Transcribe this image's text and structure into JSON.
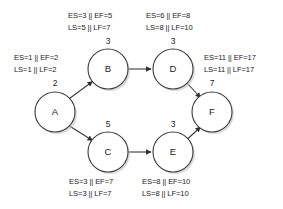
{
  "diagram": {
    "type": "activity-on-node-network",
    "separator": "||",
    "nodes": [
      {
        "id": "A",
        "label": "A",
        "duration": "2",
        "cx": 55,
        "cy": 112,
        "r": 20,
        "annotation": {
          "early": "ES=1 || EF=2",
          "late": "LS=1 || LF=2",
          "es": "ES=1",
          "ef": "EF=2",
          "ls": "LS=1",
          "lf": "LF=2"
        }
      },
      {
        "id": "B",
        "label": "B",
        "duration": "3",
        "cx": 108,
        "cy": 69,
        "r": 20,
        "annotation": {
          "early": "ES=3 || EF=5",
          "late": "LS=5 || LF=7",
          "es": "ES=3",
          "ef": "EF=5",
          "ls": "LS=5",
          "lf": "LF=7"
        }
      },
      {
        "id": "C",
        "label": "C",
        "duration": "5",
        "cx": 108,
        "cy": 152,
        "r": 20,
        "annotation": {
          "early": "ES=3 || EF=7",
          "late": "LS=3 || LF=7",
          "es": "ES=3",
          "ef": "EF=7",
          "ls": "LS=3",
          "lf": "LF=7"
        }
      },
      {
        "id": "D",
        "label": "D",
        "duration": "3",
        "cx": 173,
        "cy": 69,
        "r": 20,
        "annotation": {
          "early": "ES=6 || EF=8",
          "late": "LS=8 || LF=10",
          "es": "ES=6",
          "ef": "EF=8",
          "ls": "LS=8",
          "lf": "LF=10"
        }
      },
      {
        "id": "E",
        "label": "E",
        "duration": "3",
        "cx": 173,
        "cy": 152,
        "r": 20,
        "annotation": {
          "early": "ES=8 || EF=10",
          "late": "LS=8 || LF=10",
          "es": "ES=8",
          "ef": "EF=10",
          "ls": "LS=8",
          "lf": "LF=10"
        }
      },
      {
        "id": "F",
        "label": "F",
        "duration": "7",
        "cx": 212,
        "cy": 112,
        "r": 20,
        "annotation": {
          "early": "ES=11 || EF=17",
          "late": "LS=11 || LF=17",
          "es": "ES=11",
          "ef": "EF=17",
          "ls": "LS=11",
          "lf": "LF=17"
        }
      }
    ],
    "edges": [
      {
        "from": "A",
        "to": "B"
      },
      {
        "from": "A",
        "to": "C"
      },
      {
        "from": "B",
        "to": "D"
      },
      {
        "from": "C",
        "to": "E"
      },
      {
        "from": "D",
        "to": "F"
      },
      {
        "from": "E",
        "to": "F"
      }
    ],
    "colors": {
      "background": "#ffffff",
      "stroke": "#3a3a3a",
      "text": "#1d1d1d",
      "shadow": "#bdbdbd"
    }
  }
}
